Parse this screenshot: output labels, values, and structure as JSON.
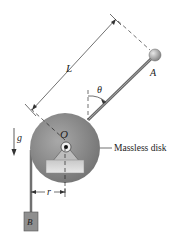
{
  "figure": {
    "labels": {
      "length": "L",
      "angle": "θ",
      "point_a": "A",
      "pivot": "O",
      "gravity": "g",
      "radius": "r",
      "block": "B",
      "disk": "Massless disk"
    },
    "colors": {
      "disk": "#8a8a8a",
      "rod": "#7a7a7a",
      "block": "#8f8f8f",
      "ink": "#222222"
    }
  }
}
